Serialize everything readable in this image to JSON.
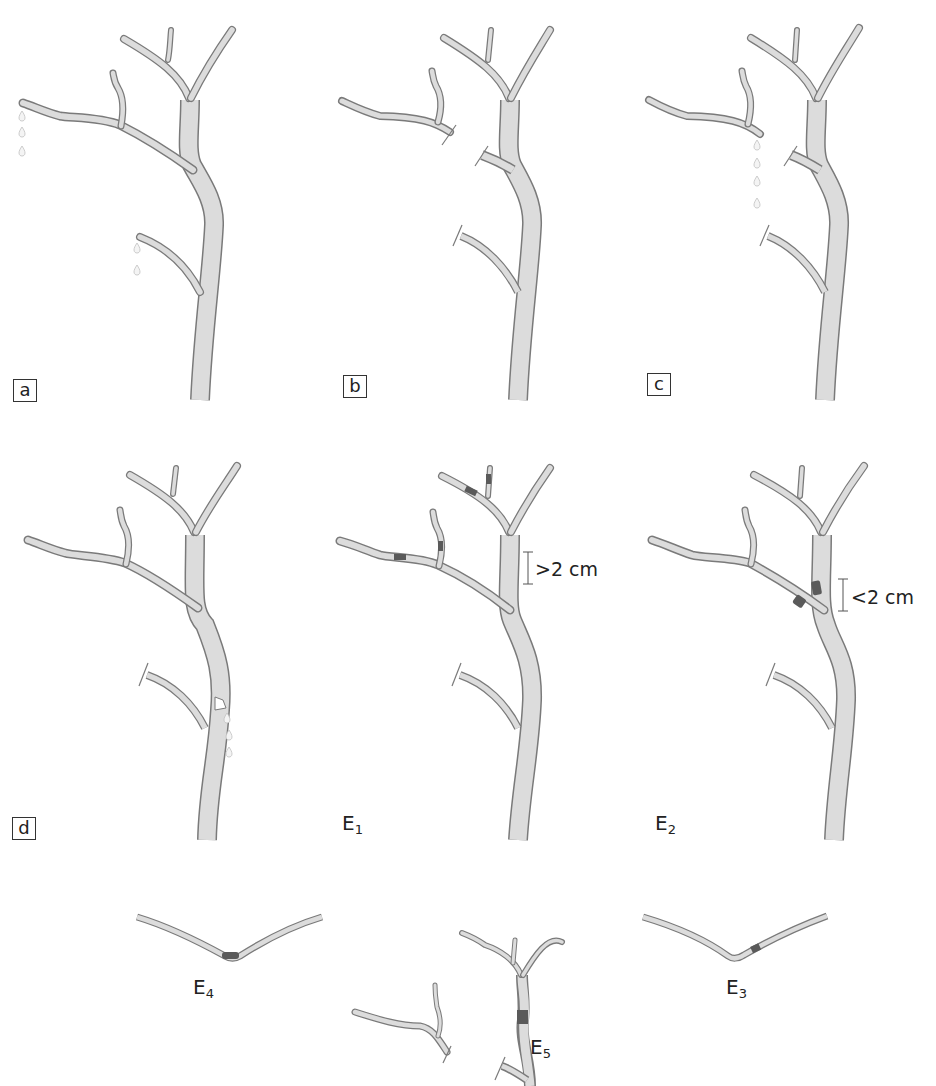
{
  "figure": {
    "panels": [
      {
        "id": "a",
        "label": "a",
        "boxed": true,
        "description": "Intact branched tree with droplets at two branch tips"
      },
      {
        "id": "b",
        "label": "b",
        "boxed": true,
        "description": "Upper-left branch cut off; lower branch stub cut"
      },
      {
        "id": "c",
        "label": "c",
        "boxed": true,
        "description": "Cut upper-left branch dripping droplets"
      },
      {
        "id": "d",
        "label": "d",
        "boxed": true,
        "description": "Trunk notch with droplets below"
      },
      {
        "id": "e1",
        "label": "E",
        "sub": "1",
        "boxed": false,
        "measure": ">2 cm",
        "description": "Dark bands on small branches, distance greater than 2 cm"
      },
      {
        "id": "e2",
        "label": "E",
        "sub": "2",
        "boxed": false,
        "measure": "<2 cm",
        "description": "Dark bands near bifurcation, distance less than 2 cm"
      },
      {
        "id": "e4",
        "label": "E",
        "sub": "4",
        "boxed": false,
        "description": "V-shaped segment with dark band at apex"
      },
      {
        "id": "e5",
        "label": "E",
        "sub": "5",
        "boxed": false,
        "description": "Partial tree with dark band on main stem"
      },
      {
        "id": "e3",
        "label": "E",
        "sub": "3",
        "boxed": false,
        "description": "V-shaped segment with dark band off apex"
      }
    ],
    "colors": {
      "fill": "#dcdcdc",
      "outline": "#7a7a7a",
      "band": "#5a5a5a",
      "droplet": "#c8c8c8"
    }
  }
}
